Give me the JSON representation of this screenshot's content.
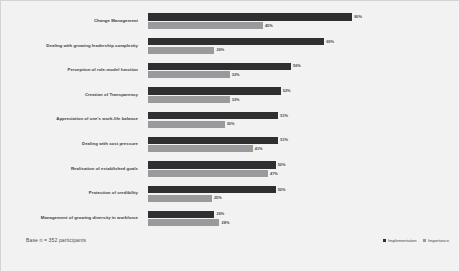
{
  "chart_data": {
    "type": "bar",
    "orientation": "horizontal",
    "title": "",
    "xlabel": "",
    "ylabel": "",
    "xlim": [
      0,
      100
    ],
    "grid": false,
    "legend_position": "bottom-right",
    "categories": [
      "Change Management",
      "Dealing with growing leadership complexity",
      "Perception of role-model function",
      "Creation of Transparency",
      "Appreciation of one's work-life balance",
      "Dealing with cost pressure",
      "Realisation of established goals",
      "Protection of credibility",
      "Management of growing diversity in workforce"
    ],
    "series": [
      {
        "name": "Implementation",
        "color": "#2f2f32",
        "values": [
          80,
          69,
          56,
          52,
          51,
          51,
          50,
          50,
          26
        ],
        "value_labels": [
          "80%",
          "69%",
          "56%",
          "52%",
          "51%",
          "51%",
          "50%",
          "50%",
          "26%"
        ]
      },
      {
        "name": "Importance",
        "color": "#9a9a9c",
        "values": [
          45,
          26,
          32,
          32,
          30,
          41,
          47,
          25,
          28
        ],
        "value_labels": [
          "45%",
          "26%",
          "32%",
          "32%",
          "30%",
          "41%",
          "47%",
          "25%",
          "28%"
        ]
      }
    ]
  },
  "footer": {
    "base_note": "Base n = 352 participants"
  },
  "legend": {
    "items": [
      {
        "label": "Implementation"
      },
      {
        "label": "Importance"
      }
    ]
  }
}
